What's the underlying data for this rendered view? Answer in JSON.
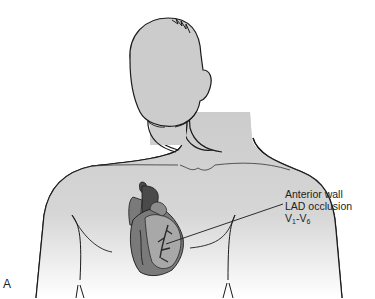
{
  "figure": {
    "panel_letter": "A",
    "annotation": {
      "line1": "Anterior wall",
      "line2": "LAD occlusion",
      "leads": {
        "start_prefix": "V",
        "start_sub": "1",
        "separator": "-",
        "end_prefix": "V",
        "end_sub": "6"
      }
    },
    "colors": {
      "body_fill": "#cfcfcf",
      "outline": "#1a1a1a",
      "heart_dark": "#4a4a4a",
      "heart_mid": "#7a7a7a",
      "heart_light": "#a8a8a8",
      "background": "#ffffff"
    }
  }
}
